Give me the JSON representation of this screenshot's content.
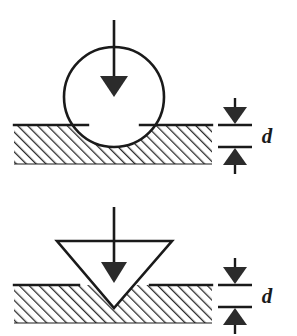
{
  "figure": {
    "background_color": "#ffffff",
    "ink_color": "#1a1a1a",
    "width": 297,
    "height": 336,
    "hatch_angle_deg": 45,
    "hatch_color": "#2b2b2b"
  },
  "panels": [
    {
      "id": "spherical-indenter-panel",
      "name": "spherical-indenter",
      "indenter_shape": "circle",
      "indenter_label": "spherical indenter",
      "load_arrow_label": "applied load",
      "surface_label": "specimen surface",
      "specimen_label": "hatched specimen material",
      "depth_label": "d",
      "depth_label_description": "indentation depth",
      "geometry": {
        "circle_center_x": 114,
        "circle_center_y": 97,
        "circle_radius": 50,
        "surface_y": 125,
        "hatch_bottom_y": 164,
        "hatch_left_x": 14,
        "hatch_right_x": 212,
        "load_arrow_x": 114,
        "load_arrow_top_y": 20,
        "load_arrow_tip_y": 96
      },
      "dimension": {
        "top_line_y": 125,
        "bottom_line_y": 147,
        "line_left_x": 218,
        "line_right_x": 252,
        "arrow_x": 235,
        "label_x": 267,
        "label_y": 143
      }
    },
    {
      "id": "conical-indenter-panel",
      "name": "conical-indenter",
      "indenter_shape": "triangle",
      "indenter_label": "conical / pyramidal indenter",
      "load_arrow_label": "applied load",
      "surface_label": "specimen surface",
      "specimen_label": "hatched specimen material",
      "depth_label": "d",
      "depth_label_description": "indentation depth",
      "geometry": {
        "triangle_left_x": 57,
        "triangle_right_x": 172,
        "triangle_top_y": 241,
        "triangle_apex_x": 114,
        "triangle_apex_y": 308,
        "surface_y": 285,
        "hatch_bottom_y": 323,
        "hatch_left_x": 14,
        "hatch_right_x": 212,
        "load_arrow_x": 114,
        "load_arrow_top_y": 207,
        "load_arrow_tip_y": 282
      },
      "dimension": {
        "top_line_y": 285,
        "bottom_line_y": 307,
        "line_left_x": 218,
        "line_right_x": 252,
        "arrow_x": 235,
        "label_x": 267,
        "label_y": 303
      }
    }
  ]
}
